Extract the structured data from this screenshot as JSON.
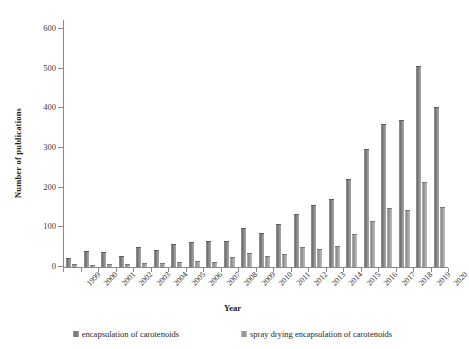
{
  "chart_data": {
    "type": "bar",
    "title": "",
    "xlabel": "Year",
    "ylabel": "Number of publications",
    "ylim": [
      0,
      600
    ],
    "ytick_step": 100,
    "yticks": [
      0,
      100,
      200,
      300,
      400,
      500,
      600
    ],
    "grid": false,
    "legend_position": "bottom",
    "categories": [
      "1999",
      "2000",
      "2001",
      "2002",
      "2003",
      "2004",
      "2005",
      "2006",
      "2007",
      "2008",
      "2009",
      "2010",
      "2011",
      "2012",
      "2013",
      "2014",
      "2015",
      "2016",
      "2017",
      "2018",
      "2019",
      "2020"
    ],
    "series": [
      {
        "name": "encapsulation of carotenoids",
        "color": "#7d7d7d",
        "values": [
          21,
          37,
          36,
          25,
          48,
          41,
          55,
          60,
          63,
          62,
          97,
          84,
          107,
          132,
          153,
          169,
          220,
          296,
          359,
          367,
          504,
          402
        ]
      },
      {
        "name": "spray drying encapsulation of carotenoids",
        "color": "#a8a8a8",
        "values": [
          5,
          3,
          5,
          6,
          7,
          8,
          10,
          13,
          9,
          22,
          33,
          26,
          31,
          48,
          44,
          51,
          80,
          114,
          146,
          142,
          211,
          150
        ]
      }
    ]
  },
  "legend": {
    "items": [
      {
        "label": "encapsulation of carotenoids"
      },
      {
        "label": "spray drying encapsulation of carotenoids"
      }
    ]
  },
  "icons": {
    "legend_swatch": "square-swatch-icon"
  }
}
